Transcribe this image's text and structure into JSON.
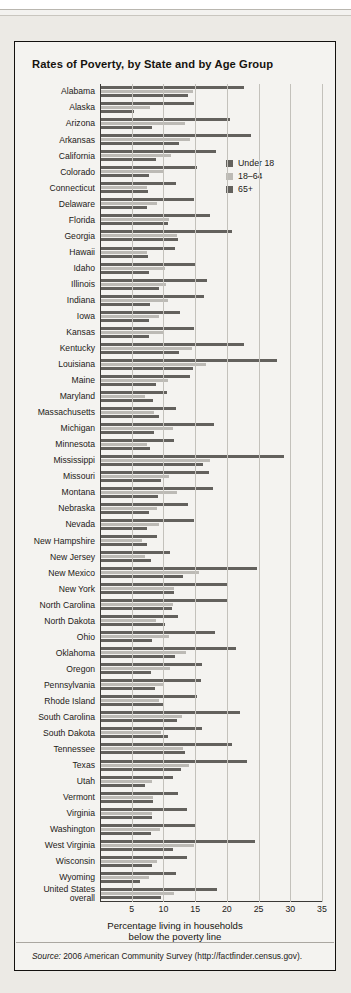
{
  "figure": {
    "title": "Rates of Poverty, by State and by Age Group",
    "source_prefix": "Source:",
    "source_text": " 2006 American Community Survey (http://factfinder.census.gov)."
  },
  "legend": {
    "position": "inside-top-right",
    "items": [
      {
        "label": "Under 18",
        "color": "#63615d"
      },
      {
        "label": "18–64",
        "color": "#bcbab5"
      },
      {
        "label": "65+",
        "color": "#63615d"
      }
    ]
  },
  "chart_data": {
    "type": "bar",
    "orientation": "horizontal",
    "title": "Rates of Poverty, by State and by Age Group",
    "xlabel_line1": "Percentage living in households",
    "xlabel_line2": "below the poverty line",
    "ylabel": "",
    "xlim": [
      0,
      35
    ],
    "xticks": [
      5,
      10,
      15,
      20,
      25,
      30,
      35
    ],
    "grid": "vertical",
    "legend_position": "inside-top-right",
    "categories": [
      "Alabama",
      "Alaska",
      "Arizona",
      "Arkansas",
      "California",
      "Colorado",
      "Connecticut",
      "Delaware",
      "Florida",
      "Georgia",
      "Hawaii",
      "Idaho",
      "Illinois",
      "Indiana",
      "Iowa",
      "Kansas",
      "Kentucky",
      "Louisiana",
      "Maine",
      "Maryland",
      "Massachusetts",
      "Michigan",
      "Minnesota",
      "Mississippi",
      "Missouri",
      "Montana",
      "Nebraska",
      "Nevada",
      "New Hampshire",
      "New Jersey",
      "New Mexico",
      "New York",
      "North Carolina",
      "North Dakota",
      "Ohio",
      "Oklahoma",
      "Oregon",
      "Pennsylvania",
      "Rhode Island",
      "South Carolina",
      "South Dakota",
      "Tennessee",
      "Texas",
      "Utah",
      "Vermont",
      "Virginia",
      "Washington",
      "West Virginia",
      "Wisconsin",
      "Wyoming",
      "United States overall"
    ],
    "category_display": [
      "Alabama",
      "Alaska",
      "Arizona",
      "Arkansas",
      "California",
      "Colorado",
      "Connecticut",
      "Delaware",
      "Florida",
      "Georgia",
      "Hawaii",
      "Idaho",
      "Illinois",
      "Indiana",
      "Iowa",
      "Kansas",
      "Kentucky",
      "Louisiana",
      "Maine",
      "Maryland",
      "Massachusetts",
      "Michigan",
      "Minnesota",
      "Mississippi",
      "Missouri",
      "Montana",
      "Nebraska",
      "Nevada",
      "New Hampshire",
      "New Jersey",
      "New Mexico",
      "New York",
      "North Carolina",
      "North Dakota",
      "Ohio",
      "Oklahoma",
      "Oregon",
      "Pennsylvania",
      "Rhode Island",
      "South Carolina",
      "South Dakota",
      "Tennessee",
      "Texas",
      "Utah",
      "Vermont",
      "Virginia",
      "Washington",
      "West Virginia",
      "Wisconsin",
      "Wyoming",
      "United States|overall"
    ],
    "series": [
      {
        "name": "Under 18",
        "color": "#63615d",
        "values": [
          22.6,
          14.6,
          20.3,
          23.7,
          18.1,
          15.2,
          11.8,
          14.6,
          17.2,
          20.7,
          11.6,
          14.9,
          16.7,
          16.3,
          12.5,
          14.6,
          22.5,
          27.8,
          14.1,
          10.4,
          11.8,
          17.8,
          11.5,
          28.8,
          17.1,
          17.6,
          13.7,
          14.7,
          8.8,
          10.8,
          24.6,
          19.8,
          19.9,
          12.1,
          17.9,
          21.3,
          16.0,
          15.7,
          15.2,
          21.9,
          15.9,
          20.6,
          23.0,
          11.4,
          12.2,
          13.5,
          14.8,
          24.3,
          13.6,
          11.9,
          18.3
        ]
      },
      {
        "name": "18–64",
        "color": "#bcbab5",
        "values": [
          14.5,
          7.7,
          13.3,
          14.1,
          11.1,
          9.9,
          7.2,
          8.9,
          10.7,
          12.0,
          7.3,
          10.1,
          10.3,
          10.5,
          9.2,
          9.8,
          14.3,
          16.5,
          10.5,
          7.0,
          8.4,
          11.4,
          7.3,
          17.2,
          10.7,
          12.0,
          8.9,
          9.2,
          6.4,
          7.0,
          15.4,
          11.5,
          11.3,
          8.6,
          10.7,
          13.4,
          10.8,
          9.7,
          9.2,
          12.7,
          9.5,
          13.0,
          13.9,
          8.0,
          8.2,
          8.0,
          9.3,
          14.6,
          8.8,
          7.6,
          11.5
        ]
      },
      {
        "name": "65+",
        "color": "#63615d",
        "values": [
          13.7,
          5.2,
          8.1,
          12.3,
          8.6,
          7.5,
          7.4,
          7.2,
          10.5,
          12.1,
          7.4,
          7.6,
          9.2,
          7.7,
          7.5,
          7.6,
          12.3,
          14.5,
          8.7,
          8.2,
          9.1,
          8.4,
          7.8,
          16.1,
          9.4,
          9.0,
          7.6,
          7.3,
          7.2,
          7.9,
          12.9,
          11.5,
          11.2,
          10.1,
          8.0,
          11.6,
          7.9,
          8.5,
          9.9,
          12.0,
          10.6,
          13.3,
          12.6,
          6.9,
          8.2,
          8.0,
          7.9,
          11.4,
          8.0,
          6.1,
          9.4
        ]
      }
    ]
  }
}
